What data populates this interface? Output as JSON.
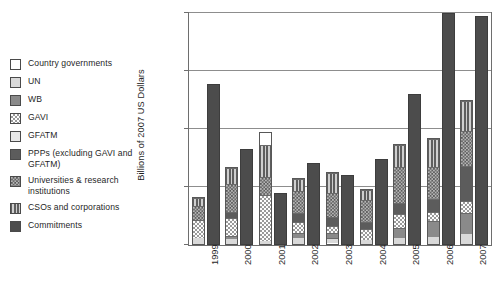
{
  "chart_data": {
    "type": "bar",
    "title": "",
    "subtitle": "",
    "xlabel": "",
    "ylabel": "Billions of 2007 US Dollars",
    "ylim": [
      0,
      2
    ],
    "yticks": [
      0,
      0.5,
      1,
      1.5,
      2
    ],
    "ytick_labels": [
      "0",
      "0.5",
      "1",
      "1.5",
      "2"
    ],
    "grid": true,
    "legend_position": "left-outside",
    "categories": [
      "1999",
      "2000",
      "2001",
      "2002",
      "2003",
      "2004",
      "2005",
      "2006",
      "2007"
    ],
    "stacked_series": [
      {
        "name": "Country governments",
        "pattern": "white",
        "values": [
          0.0,
          0.0,
          0.0,
          0.0,
          0.01,
          0.0,
          0.0,
          0.0,
          0.0
        ]
      },
      {
        "name": "UN",
        "pattern": "light-grey",
        "values": [
          0.05,
          0.04,
          0.03,
          0.05,
          0.04,
          0.04,
          0.05,
          0.06,
          0.09
        ]
      },
      {
        "name": "WB",
        "pattern": "mid-grey",
        "values": [
          0.0,
          0.03,
          0.0,
          0.05,
          0.05,
          0.0,
          0.09,
          0.14,
          0.18
        ]
      },
      {
        "name": "GAVI",
        "pattern": "checker-light",
        "values": [
          0.17,
          0.16,
          0.4,
          0.1,
          0.06,
          0.09,
          0.12,
          0.08,
          0.11
        ]
      },
      {
        "name": "GFATM",
        "pattern": "pale-grey",
        "values": [
          0.0,
          0.0,
          0.0,
          0.0,
          0.0,
          0.0,
          0.0,
          0.0,
          0.0
        ]
      },
      {
        "name": "PPPs (excluding GAVI and GFATM)",
        "pattern": "dark-grey",
        "values": [
          0.0,
          0.05,
          0.0,
          0.08,
          0.08,
          0.07,
          0.1,
          0.12,
          0.3
        ]
      },
      {
        "name": "Universities & research institutions",
        "pattern": "checker-dark",
        "values": [
          0.12,
          0.25,
          0.16,
          0.19,
          0.21,
          0.19,
          0.32,
          0.28,
          0.31
        ]
      },
      {
        "name": "CSOs and corporations",
        "pattern": "vertical-stripe",
        "values": [
          0.07,
          0.14,
          0.28,
          0.11,
          0.18,
          0.09,
          0.19,
          0.24,
          0.26
        ]
      }
    ],
    "stacked_totals": [
      0.41,
      0.67,
      0.97,
      0.58,
      0.63,
      0.48,
      0.87,
      0.92,
      1.25
    ],
    "commitments_series": {
      "name": "Commitments",
      "pattern": "solid-dark",
      "values": [
        1.39,
        0.83,
        0.45,
        0.71,
        0.6,
        0.74,
        1.3,
        2.0,
        1.97
      ]
    }
  },
  "legend": {
    "items": [
      {
        "label": "Country governments",
        "swatch": "p-white",
        "icon": "legend-swatch-country-governments"
      },
      {
        "label": "UN",
        "swatch": "p-lightgrey",
        "icon": "legend-swatch-un"
      },
      {
        "label": "WB",
        "swatch": "p-midgrey",
        "icon": "legend-swatch-wb"
      },
      {
        "label": "GAVI",
        "swatch": "p-checker-light",
        "icon": "legend-swatch-gavi"
      },
      {
        "label": "GFATM",
        "swatch": "p-palegrey",
        "icon": "legend-swatch-gfatm"
      },
      {
        "label": "PPPs (excluding GAVI and GFATM)",
        "swatch": "p-darkgrey",
        "icon": "legend-swatch-ppps"
      },
      {
        "label": "Universities & research institutions",
        "swatch": "p-checker-dark",
        "icon": "legend-swatch-universities"
      },
      {
        "label": "CSOs and corporations",
        "swatch": "p-vstripe",
        "icon": "legend-swatch-csos"
      },
      {
        "label": "Commitments",
        "swatch": "p-darkest",
        "icon": "legend-swatch-commitments"
      }
    ]
  },
  "colors": {
    "axis": "#6e6e6e",
    "grid": "#8d8d8d",
    "commitments": "#4c4c4c",
    "text": "#1f1f1f",
    "background": "#ffffff"
  }
}
